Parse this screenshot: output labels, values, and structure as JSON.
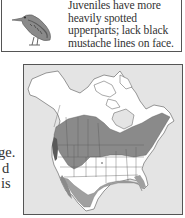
{
  "id_box": {
    "caption_lines": [
      "Juveniles have more",
      "heavily spotted",
      "upperparts; lack black",
      "mustache lines on face."
    ],
    "illustration": "juvenile-heron-bird-icon"
  },
  "body_text_fragments": [
    "ge.",
    "d",
    "is"
  ],
  "range_map": {
    "label": "range-map-north-america",
    "colors": {
      "background": "#e4e4e4",
      "land": "#ffffff",
      "year_round_range": "#7a7a7a",
      "breeding_range": "#8e8e8e",
      "winter_range": "#a8a8a8",
      "borders": "#555555"
    }
  }
}
